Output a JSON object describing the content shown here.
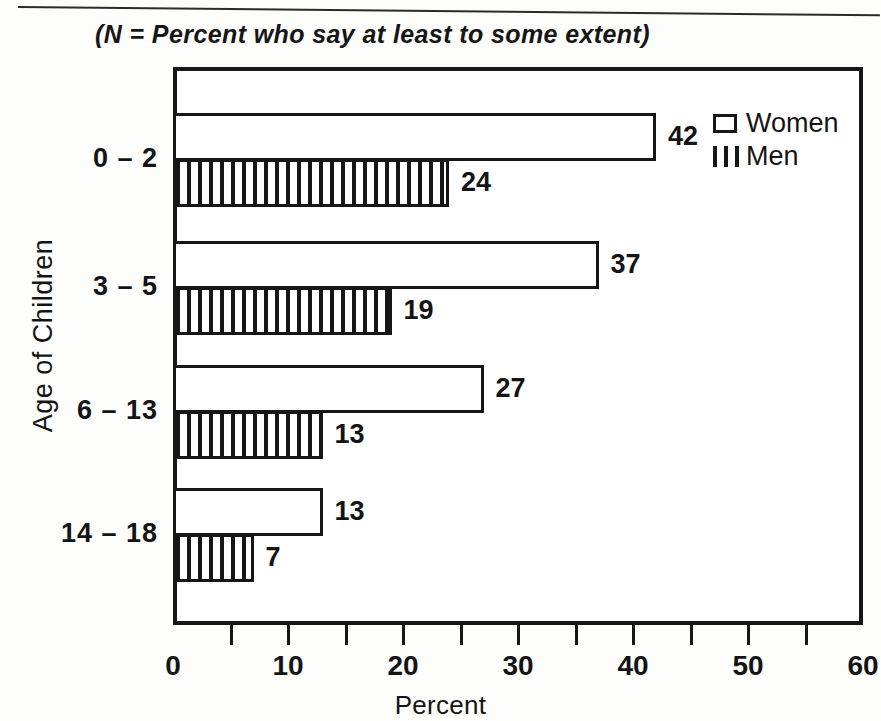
{
  "subtitle": "(N  =  Percent who say at least to some extent)",
  "legend": {
    "women_label": "Women",
    "men_label": "Men"
  },
  "chart_data": {
    "type": "bar",
    "orientation": "horizontal",
    "title": "",
    "subtitle": "(N  =  Percent who say at least to some extent)",
    "xlabel": "Percent",
    "ylabel": "Age of Children",
    "categories": [
      "0 – 2",
      "3 – 5",
      "6 – 13",
      "14 – 18"
    ],
    "series": [
      {
        "name": "Women",
        "pattern": "open",
        "values": [
          42,
          37,
          27,
          13
        ]
      },
      {
        "name": "Men",
        "pattern": "vertical-hatch",
        "values": [
          24,
          19,
          13,
          7
        ]
      }
    ],
    "xlim": [
      0,
      60
    ],
    "xticks": [
      0,
      10,
      20,
      30,
      40,
      50,
      60
    ],
    "xtick_labels": [
      "0",
      "10",
      "20",
      "30",
      "40",
      "50",
      "60"
    ],
    "minor_tick_step": 5,
    "grid": false,
    "legend_position": "top-right",
    "value_labels": [
      {
        "category": "0 – 2",
        "series": "Women",
        "value": "42"
      },
      {
        "category": "0 – 2",
        "series": "Men",
        "value": "24"
      },
      {
        "category": "3 – 5",
        "series": "Women",
        "value": "37"
      },
      {
        "category": "3 – 5",
        "series": "Men",
        "value": "19"
      },
      {
        "category": "6 – 13",
        "series": "Women",
        "value": "27"
      },
      {
        "category": "6 – 13",
        "series": "Men",
        "value": "13"
      },
      {
        "category": "14 – 18",
        "series": "Women",
        "value": "13"
      },
      {
        "category": "14 – 18",
        "series": "Men",
        "value": "7"
      }
    ]
  },
  "colors": {
    "ink": "#161616",
    "paper": "#ffffff"
  }
}
